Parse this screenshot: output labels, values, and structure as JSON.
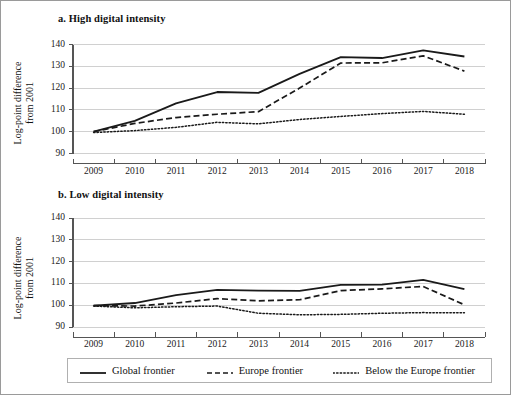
{
  "figure": {
    "border_color": "#9a9a9a",
    "background": "#ffffff",
    "line_color": "#1a1a1a",
    "grid_color": "#d0d0d0",
    "axis_color": "#555555"
  },
  "panels": [
    {
      "id": "a",
      "title": "a. High digital intensity",
      "ylabel_line1": "Log-point difference",
      "ylabel_line2": "from 2001"
    },
    {
      "id": "b",
      "title": "b. Low digital intensity",
      "ylabel_line1": "Log-point difference",
      "ylabel_line2": "from 2001"
    }
  ],
  "legend": {
    "items": [
      {
        "label": "Global frontier",
        "style": "solid"
      },
      {
        "label": "Europe frontier",
        "style": "dashed"
      },
      {
        "label": "Below the Europe frontier",
        "style": "dotted"
      }
    ]
  },
  "axis": {
    "y_ticks": [
      90,
      100,
      110,
      120,
      130,
      140
    ],
    "x_ticks": [
      "2009",
      "2010",
      "2011",
      "2012",
      "2013",
      "2014",
      "2015",
      "2016",
      "2017",
      "2018"
    ]
  },
  "chart_data": [
    {
      "type": "line",
      "panel": "a",
      "title": "a. High digital intensity",
      "xlabel": "",
      "ylabel": "Log-point difference from 2001",
      "x": [
        2009,
        2010,
        2011,
        2012,
        2013,
        2014,
        2015,
        2016,
        2017,
        2018
      ],
      "categories": [
        "2009",
        "2010",
        "2011",
        "2012",
        "2013",
        "2014",
        "2015",
        "2016",
        "2017",
        "2018"
      ],
      "ylim": [
        90,
        140
      ],
      "yticks": [
        90,
        100,
        110,
        120,
        130,
        140
      ],
      "grid": true,
      "legend_position": "below-figure",
      "series": [
        {
          "name": "Global frontier",
          "style": "solid",
          "values": [
            100.0,
            105.0,
            113.0,
            118.2,
            117.8,
            126.5,
            134.2,
            133.8,
            137.3,
            134.5
          ]
        },
        {
          "name": "Europe frontier",
          "style": "dashed",
          "values": [
            100.0,
            103.8,
            106.5,
            108.0,
            109.2,
            120.0,
            131.5,
            131.6,
            134.8,
            127.8
          ]
        },
        {
          "name": "Below the Europe frontier",
          "style": "dotted",
          "values": [
            99.6,
            100.5,
            102.0,
            104.3,
            103.6,
            105.6,
            107.0,
            108.3,
            109.3,
            108.0
          ]
        }
      ]
    },
    {
      "type": "line",
      "panel": "b",
      "title": "b. Low digital intensity",
      "xlabel": "",
      "ylabel": "Log-point difference from 2001",
      "x": [
        2009,
        2010,
        2011,
        2012,
        2013,
        2014,
        2015,
        2016,
        2017,
        2018
      ],
      "categories": [
        "2009",
        "2010",
        "2011",
        "2012",
        "2013",
        "2014",
        "2015",
        "2016",
        "2017",
        "2018"
      ],
      "ylim": [
        90,
        140
      ],
      "yticks": [
        90,
        100,
        110,
        120,
        130,
        140
      ],
      "grid": true,
      "legend_position": "below-figure",
      "series": [
        {
          "name": "Global frontier",
          "style": "solid",
          "values": [
            99.8,
            101.0,
            104.6,
            107.0,
            106.7,
            106.6,
            109.3,
            109.4,
            111.6,
            107.4
          ]
        },
        {
          "name": "Europe frontier",
          "style": "dashed",
          "values": [
            99.8,
            99.6,
            101.0,
            103.0,
            102.0,
            102.5,
            106.7,
            107.5,
            108.6,
            100.2
          ]
        },
        {
          "name": "Below the Europe frontier",
          "style": "dotted",
          "values": [
            99.6,
            98.8,
            99.3,
            99.6,
            96.3,
            95.6,
            95.8,
            96.3,
            96.6,
            96.5
          ]
        }
      ]
    }
  ]
}
